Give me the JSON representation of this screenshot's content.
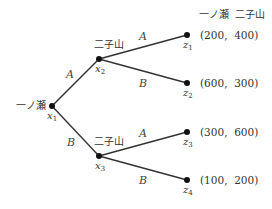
{
  "header": {
    "player1": "一ノ瀬",
    "player2": "二子山"
  },
  "nodes": {
    "x1": {
      "label": "x",
      "sub": "1",
      "player": "一ノ瀬"
    },
    "x2": {
      "label": "x",
      "sub": "2",
      "player": "二子山"
    },
    "x3": {
      "label": "x",
      "sub": "3",
      "player": "二子山"
    }
  },
  "edges": {
    "x1_x2": "A",
    "x1_x3": "B",
    "x2_z1": "A",
    "x2_z2": "B",
    "x3_z3": "A",
    "x3_z4": "B"
  },
  "terminals": [
    {
      "label": "z",
      "sub": "1",
      "payoff": "(200,  400)"
    },
    {
      "label": "z",
      "sub": "2",
      "payoff": "(600,  300)"
    },
    {
      "label": "z",
      "sub": "3",
      "payoff": "(300,  600)"
    },
    {
      "label": "z",
      "sub": "4",
      "payoff": "(100,  200)"
    }
  ]
}
